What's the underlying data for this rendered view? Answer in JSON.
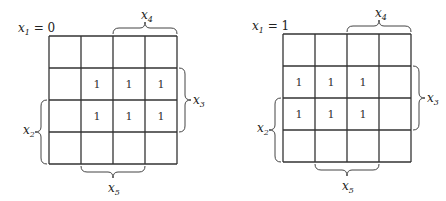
{
  "maps": [
    {
      "title_var": "x",
      "title_sub": "1",
      "title_eq": " = 0",
      "origin": [
        49,
        36
      ],
      "cell": 32,
      "cells": [
        [
          "",
          "",
          "",
          ""
        ],
        [
          "",
          "1",
          "1",
          "1"
        ],
        [
          "",
          "1",
          "1",
          "1"
        ],
        [
          "",
          "",
          "",
          ""
        ]
      ],
      "labels": {
        "top": {
          "var": "x",
          "sub": "4"
        },
        "right": {
          "var": "x",
          "sub": "3"
        },
        "left": {
          "var": "x",
          "sub": "2"
        },
        "bottom": {
          "var": "x",
          "sub": "5"
        }
      }
    },
    {
      "title_var": "x",
      "title_sub": "1",
      "title_eq": " = 1",
      "origin": [
        283,
        34
      ],
      "cell": 32,
      "cells": [
        [
          "",
          "",
          "",
          ""
        ],
        [
          "1",
          "1",
          "1",
          ""
        ],
        [
          "1",
          "1",
          "1",
          ""
        ],
        [
          "",
          "",
          "",
          ""
        ]
      ],
      "labels": {
        "top": {
          "var": "x",
          "sub": "4"
        },
        "right": {
          "var": "x",
          "sub": "3"
        },
        "left": {
          "var": "x",
          "sub": "2"
        },
        "bottom": {
          "var": "x",
          "sub": "5"
        }
      }
    }
  ]
}
